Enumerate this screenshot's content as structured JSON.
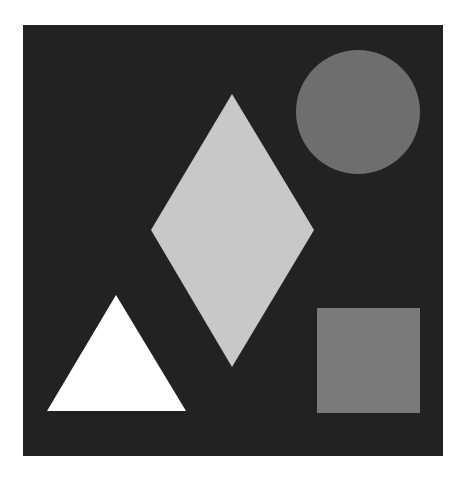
{
  "canvas": {
    "width": 461,
    "height": 481,
    "page_background": "#ffffff"
  },
  "panel": {
    "x": 23,
    "y": 25,
    "width": 420,
    "height": 431,
    "fill": "#222222"
  },
  "shapes": {
    "circle": {
      "cx": 358,
      "cy": 112,
      "r": 62,
      "fill": "#6e6e6e"
    },
    "diamond": {
      "points": "232,94 314,230 232,367 151,230",
      "fill": "#c8c8c8"
    },
    "triangle": {
      "points": "116,295 186,411 47,411",
      "fill": "#ffffff"
    },
    "square": {
      "x": 317,
      "y": 308,
      "width": 103,
      "height": 105,
      "fill": "#7a7a7a"
    }
  }
}
